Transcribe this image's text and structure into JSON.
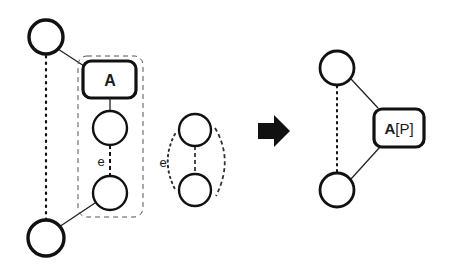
{
  "diagram": {
    "left": {
      "box_label": "A",
      "edge_label": "e"
    },
    "middle": {
      "edge_label": "e"
    },
    "right": {
      "box_label_main": "A",
      "box_label_param": "[P]"
    },
    "arrow": "transformation-arrow",
    "colors": {
      "stroke": "#111111",
      "background": "#ffffff"
    }
  }
}
